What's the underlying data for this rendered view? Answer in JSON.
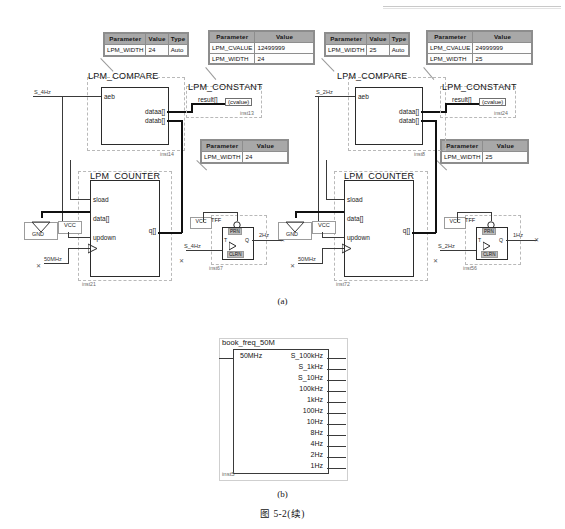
{
  "figure": {
    "caption_a": "(a)",
    "caption_b": "(b)",
    "figure_number": "图 5-2(续)"
  },
  "circuit_left": {
    "compare": {
      "title": "LPM_COMPARE",
      "instance": "inst14",
      "pin_aeb": "aeb",
      "pin_dataa": "dataa[]",
      "pin_datab": "datab[]",
      "input_net": "S_4Hz",
      "params": {
        "headers": [
          "Parameter",
          "Value",
          "Type"
        ],
        "rows": [
          [
            "LPM_WIDTH",
            "24",
            "Auto"
          ]
        ]
      }
    },
    "constant": {
      "title": "LPM_CONSTANT",
      "instance": "inst13",
      "pin_result": "result[]",
      "chip_label": "(cvalue)",
      "params": {
        "headers": [
          "Parameter",
          "Value"
        ],
        "rows": [
          [
            "LPM_CVALUE",
            "12499999"
          ],
          [
            "LPM_WIDTH",
            "24"
          ]
        ]
      }
    },
    "counter": {
      "title": "LPM_COUNTER",
      "instance": "inst21",
      "pin_sload": "sload",
      "pin_data": "data[]",
      "pin_updown": "updown",
      "pin_q": "q[]",
      "clock_net": "50MHz",
      "vcc_label": "VCC",
      "gnd_label": "GND",
      "params": {
        "headers": [
          "Parameter",
          "Value"
        ],
        "rows": [
          [
            "LPM_WIDTH",
            "24"
          ]
        ]
      }
    },
    "tff": {
      "title": "TFF",
      "instance": "inst67",
      "vcc_label": "VCC",
      "pin_t": "T",
      "pin_q": "Q",
      "pin_prn": "PRN",
      "pin_clrn": "CLRN",
      "clock_net": "S_4Hz",
      "output_net": "2Hz"
    }
  },
  "circuit_right": {
    "compare": {
      "title": "LPM_COMPARE",
      "instance": "inst8",
      "pin_aeb": "aeb",
      "pin_dataa": "dataa[]",
      "pin_datab": "datab[]",
      "input_net": "S_2Hz",
      "params": {
        "headers": [
          "Parameter",
          "Value",
          "Type"
        ],
        "rows": [
          [
            "LPM_WIDTH",
            "25",
            "Auto"
          ]
        ]
      }
    },
    "constant": {
      "title": "LPM_CONSTANT",
      "instance": "inst24",
      "pin_result": "result[]",
      "chip_label": "(cvalue)",
      "params": {
        "headers": [
          "Parameter",
          "Value"
        ],
        "rows": [
          [
            "LPM_CVALUE",
            "24999999"
          ],
          [
            "LPM_WIDTH",
            "25"
          ]
        ]
      }
    },
    "counter": {
      "title": "LPM_COUNTER",
      "instance": "inst72",
      "pin_sload": "sload",
      "pin_data": "data[]",
      "pin_updown": "updown",
      "pin_q": "q[]",
      "clock_net": "50MHz",
      "vcc_label": "VCC",
      "gnd_label": "GND",
      "params": {
        "headers": [
          "Parameter",
          "Value"
        ],
        "rows": [
          [
            "LPM_WIDTH",
            "25"
          ]
        ]
      }
    },
    "tff": {
      "title": "TFF",
      "instance": "inst56",
      "vcc_label": "VCC",
      "pin_t": "T",
      "pin_q": "Q",
      "pin_prn": "PRN",
      "pin_clrn": "CLRN",
      "clock_net": "S_2Hz",
      "output_net": "1Hz"
    }
  },
  "symbol_block": {
    "name": "book_freq_50M",
    "instance": "inst5",
    "input_port": "50MHz",
    "output_ports": [
      "S_100kHz",
      "S_1kHz",
      "S_10Hz",
      "100kHz",
      "1kHz",
      "100Hz",
      "10Hz",
      "8Hz",
      "4Hz",
      "2Hz",
      "1Hz"
    ]
  }
}
